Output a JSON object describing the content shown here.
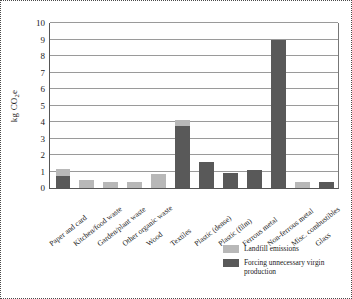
{
  "chart_data": {
    "type": "bar",
    "title": "",
    "subtitle": "",
    "xlabel": "",
    "ylabel": "kg CO2e",
    "ylabel_parts": {
      "prefix": "kg CO",
      "sub": "2",
      "suffix": "e"
    },
    "ylim": [
      0,
      10
    ],
    "yticks": [
      0,
      1,
      2,
      3,
      4,
      5,
      6,
      7,
      8,
      9,
      10
    ],
    "ytick_labels": [
      "0",
      "1",
      "2",
      "3",
      "4",
      "5",
      "6",
      "7",
      "8",
      "9",
      "10"
    ],
    "grid": true,
    "stacked": true,
    "legend_position": "bottom-right",
    "categories": [
      "Paper and card",
      "Kitchen/food waste",
      "Garden/plant waste",
      "Other organic waste",
      "Wood",
      "Textiles",
      "Plastic (dense)",
      "Plastic (film)",
      "Ferrous metal",
      "Non-ferrous metal",
      "Misc. combustibles",
      "Glass"
    ],
    "series": [
      {
        "name": "Landfill emissions",
        "color": "#b8b8b8",
        "values": [
          0.45,
          0.5,
          0.38,
          0.38,
          0.85,
          0.35,
          0,
          0,
          0,
          0,
          0.35,
          0
        ]
      },
      {
        "name": "Forcing unnecessary virgin production",
        "color": "#595959",
        "values": [
          0.7,
          0,
          0,
          0,
          0,
          3.75,
          1.55,
          0.92,
          1.1,
          8.9,
          0,
          0.37
        ]
      }
    ],
    "totals": [
      1.15,
      0.5,
      0.38,
      0.38,
      0.85,
      4.1,
      1.55,
      0.92,
      1.1,
      8.9,
      0.35,
      0.37
    ]
  },
  "legend": {
    "items": [
      {
        "label": "Landfill emissions",
        "color": "#b8b8b8"
      },
      {
        "label": "Forcing unnecessary virgin production",
        "color": "#595959"
      }
    ]
  },
  "colors": {
    "landfill": "#b8b8b8",
    "virgin": "#595959",
    "grid": "#9a9a9a",
    "axis": "#555555",
    "frame": "#4a4a4a",
    "background": "#ffffff"
  }
}
